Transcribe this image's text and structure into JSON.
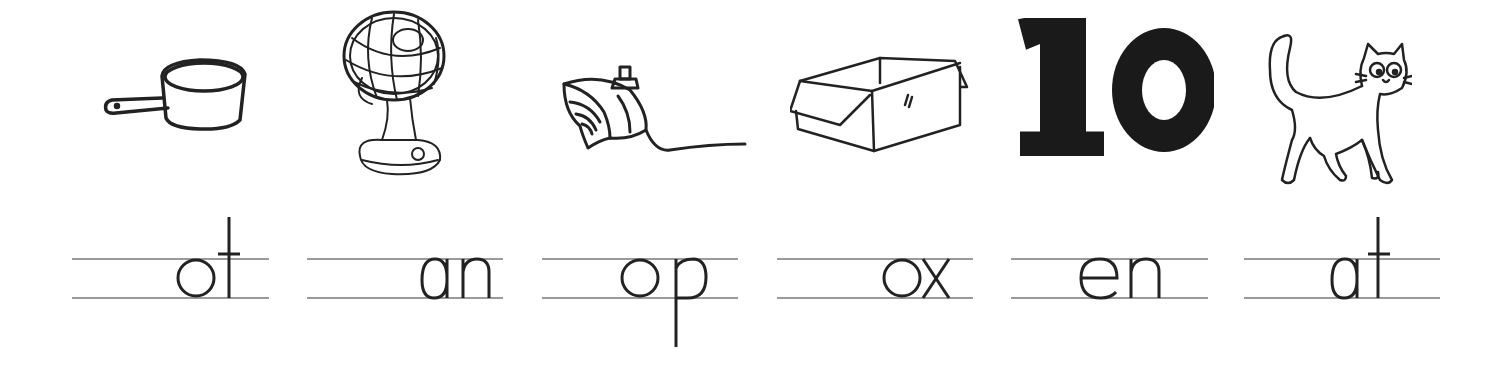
{
  "worksheet": {
    "items": [
      {
        "picture": "saucepan",
        "word": "pot",
        "missing_letter": "p",
        "shown_letters": "ot"
      },
      {
        "picture": "electric fan",
        "word": "fan",
        "missing_letter": "f",
        "shown_letters": "an"
      },
      {
        "picture": "spinning top",
        "word": "top",
        "missing_letter": "t",
        "shown_letters": "op"
      },
      {
        "picture": "cardboard box",
        "word": "box",
        "missing_letter": "b",
        "shown_letters": "ox"
      },
      {
        "picture": "number 10",
        "word": "ten",
        "missing_letter": "t",
        "shown_letters": "en",
        "number_label": "10"
      },
      {
        "picture": "cat",
        "word": "cat",
        "missing_letter": "c",
        "shown_letters": "at"
      }
    ]
  },
  "colors": {
    "ink": "#222222",
    "rule": "#9a9a9a",
    "background": "#ffffff"
  }
}
